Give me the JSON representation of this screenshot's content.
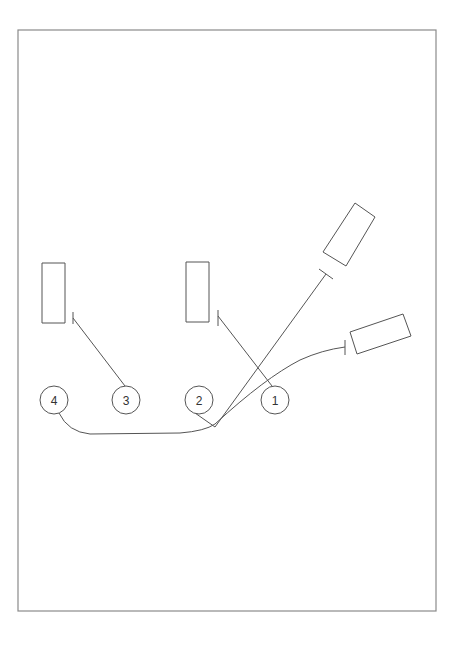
{
  "diagram": {
    "type": "callout-diagram",
    "colors": {
      "stroke": "#555555",
      "frame": "#8a8a8a",
      "background": "#ffffff",
      "text": "#333333"
    },
    "frame": {
      "x": 18,
      "y": 30,
      "width": 418,
      "height": 581
    },
    "callouts": [
      {
        "id": "1",
        "label": "1",
        "cx": 275,
        "cy": 400,
        "r": 14
      },
      {
        "id": "2",
        "label": "2",
        "cx": 199,
        "cy": 400,
        "r": 14
      },
      {
        "id": "3",
        "label": "3",
        "cx": 126,
        "cy": 400,
        "r": 14
      },
      {
        "id": "4",
        "label": "4",
        "cx": 54,
        "cy": 400,
        "r": 14
      }
    ],
    "components": [
      {
        "id": "rect-left",
        "shape": "rectangle",
        "points": "42,263 65,263 65,323 42,323"
      },
      {
        "id": "rect-middle",
        "shape": "rectangle",
        "points": "186,262 209,262 209,322 186,322"
      },
      {
        "id": "rect-upper-right",
        "shape": "rotated-rectangle",
        "points": "355,203 375,217 346,266 323,252"
      },
      {
        "id": "rect-lower-right",
        "shape": "rotated-rectangle",
        "points": "350,332 403,314 411,336 357,354"
      }
    ],
    "leaders": [
      {
        "from": "3",
        "to": "rect-left",
        "path": "M 125 386 L 73 318",
        "tick": "M 73 312 L 73 324"
      },
      {
        "from": "1",
        "to": "rect-middle",
        "path": "M 272 386 L 218 316",
        "tick": "M 218 310 L 218 326"
      },
      {
        "from": "2",
        "to": "rect-upper-right",
        "path": "M 195 413 L 215 427 L 326 274",
        "tick": "M 319 269 L 333 279"
      },
      {
        "from": "4",
        "to": "rect-lower-right",
        "path": "M 59 413 Q 68 432 90 434 L 180 433 Q 205 431 215 424 Q 265 378 300 360 Q 322 350 345 347",
        "tick": "M 345 340 L 345 355"
      }
    ]
  }
}
